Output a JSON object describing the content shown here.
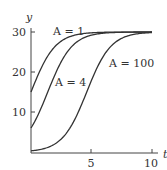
{
  "chart_data": {
    "type": "line",
    "title": "",
    "xlabel": "t",
    "ylabel": "y",
    "xlim": [
      0,
      10
    ],
    "ylim": [
      0,
      30
    ],
    "x_ticks": [
      5,
      10
    ],
    "y_ticks": [
      10,
      20,
      30
    ],
    "grid": false,
    "legend": "inline labels",
    "formula": "y = 30 / (1 + A e^{-t})",
    "series": [
      {
        "name": "A = 1",
        "label": "A = 1",
        "A": 1,
        "x": [
          0,
          1,
          2,
          3,
          4,
          5,
          6,
          7,
          8,
          9,
          10
        ],
        "values": [
          15.0,
          22.3,
          26.6,
          28.6,
          29.5,
          29.8,
          29.9,
          30.0,
          30.0,
          30.0,
          30.0
        ]
      },
      {
        "name": "A = 4",
        "label": "A = 4",
        "A": 4,
        "x": [
          0,
          1,
          2,
          3,
          4,
          5,
          6,
          7,
          8,
          9,
          10
        ],
        "values": [
          6.0,
          12.2,
          19.7,
          25.0,
          28.0,
          29.2,
          29.7,
          29.9,
          30.0,
          30.0,
          30.0
        ]
      },
      {
        "name": "A = 100",
        "label": "A = 100",
        "A": 100,
        "x": [
          0,
          1,
          2,
          3,
          4,
          5,
          6,
          7,
          8,
          9,
          10
        ],
        "values": [
          0.3,
          0.8,
          2.0,
          5.0,
          10.5,
          18.0,
          24.0,
          27.5,
          29.0,
          29.6,
          29.9
        ]
      }
    ]
  },
  "labels": {
    "y_axis": "y",
    "x_axis": "t",
    "tick_30": "30",
    "tick_20": "20",
    "tick_10": "10",
    "tick_5": "5",
    "tick_x10": "10",
    "curve_a1": "A = 1",
    "curve_a4": "A = 4",
    "curve_a100": "A = 100"
  }
}
